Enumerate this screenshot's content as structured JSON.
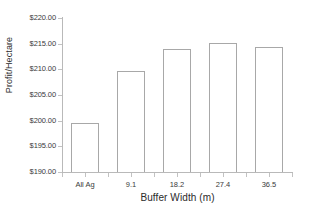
{
  "chart_data": {
    "type": "bar",
    "title": "",
    "xlabel": "Buffer Width (m)",
    "ylabel": "Profit/Hectare",
    "categories": [
      "All Ag",
      "9.1",
      "18.2",
      "27.4",
      "36.5"
    ],
    "values": [
      199.6,
      209.6,
      213.9,
      215.1,
      214.3
    ],
    "value_labels": [
      "$199.60",
      "$209.60",
      "$213.90",
      "$215.10",
      "$214.30"
    ],
    "ylim": [
      190.0,
      220.0
    ],
    "ytick_values": [
      190.0,
      195.0,
      200.0,
      205.0,
      210.0,
      215.0,
      220.0
    ],
    "ytick_labels": [
      "$190.00",
      "$195.00",
      "$200.00",
      "$205.00",
      "$210.00",
      "$215.00",
      "$220.00"
    ],
    "grid": false,
    "legend": null,
    "legend_position": "none",
    "bar_fill_color": "#ffffff",
    "bar_edge_color": "#a8a8a8",
    "axis_color": "#b9b9b9",
    "text_color": "#2b2b2b"
  }
}
